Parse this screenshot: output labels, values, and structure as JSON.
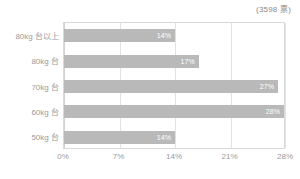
{
  "header": {
    "vote_note": "(3598 票)"
  },
  "chart_data": {
    "type": "bar",
    "orientation": "horizontal",
    "title": "",
    "subtitle": "",
    "xlabel": "",
    "ylabel": "",
    "categories": [
      "80kg 台以上",
      "80kg 台",
      "70kg 台",
      "60kg 台",
      "50kg 台"
    ],
    "values": [
      14,
      17,
      27,
      28,
      14
    ],
    "value_labels": [
      "14%",
      "17%",
      "27%",
      "28%",
      "14%"
    ],
    "xlim": [
      0,
      28
    ],
    "xticks": [
      0,
      7,
      14,
      21,
      28
    ],
    "xtick_labels": [
      "0%",
      "7%",
      "14%",
      "21%",
      "28%"
    ],
    "grid": true,
    "legend": false,
    "annotations": [
      "(3598 票)"
    ],
    "colors": {
      "bar": "#b9b9b9",
      "bar_label": "#ffffff",
      "axis_text": "#9b9b9b",
      "gridline": "#e2e2e2",
      "plot_border": "#d9d9d9",
      "background": "#ffffff",
      "note_text": "#8a8a8a"
    }
  }
}
